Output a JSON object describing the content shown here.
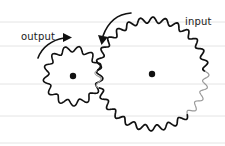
{
  "diagram": {
    "type": "gear-train",
    "paper": {
      "background": "#ffffff",
      "rule_color": "#e4e4e4",
      "rule_y": [
        22,
        46,
        84,
        116,
        143
      ]
    },
    "gears": [
      {
        "id": "output",
        "label": "output",
        "center": [
          73,
          76
        ],
        "outer_radius": 30,
        "root_radius": 24,
        "teeth": 13,
        "stroke": "#111111",
        "rotation_arrow": "clockwise"
      },
      {
        "id": "input",
        "label": "input",
        "center": [
          152,
          74
        ],
        "outer_radius": 57,
        "root_radius": 51,
        "teeth": 28,
        "stroke": "#111111",
        "faded_stroke": "#9a9a9a",
        "rotation_arrow": "counter-clockwise"
      }
    ],
    "labels": {
      "output": "output",
      "input": "input"
    },
    "ink_color": "#111111"
  }
}
